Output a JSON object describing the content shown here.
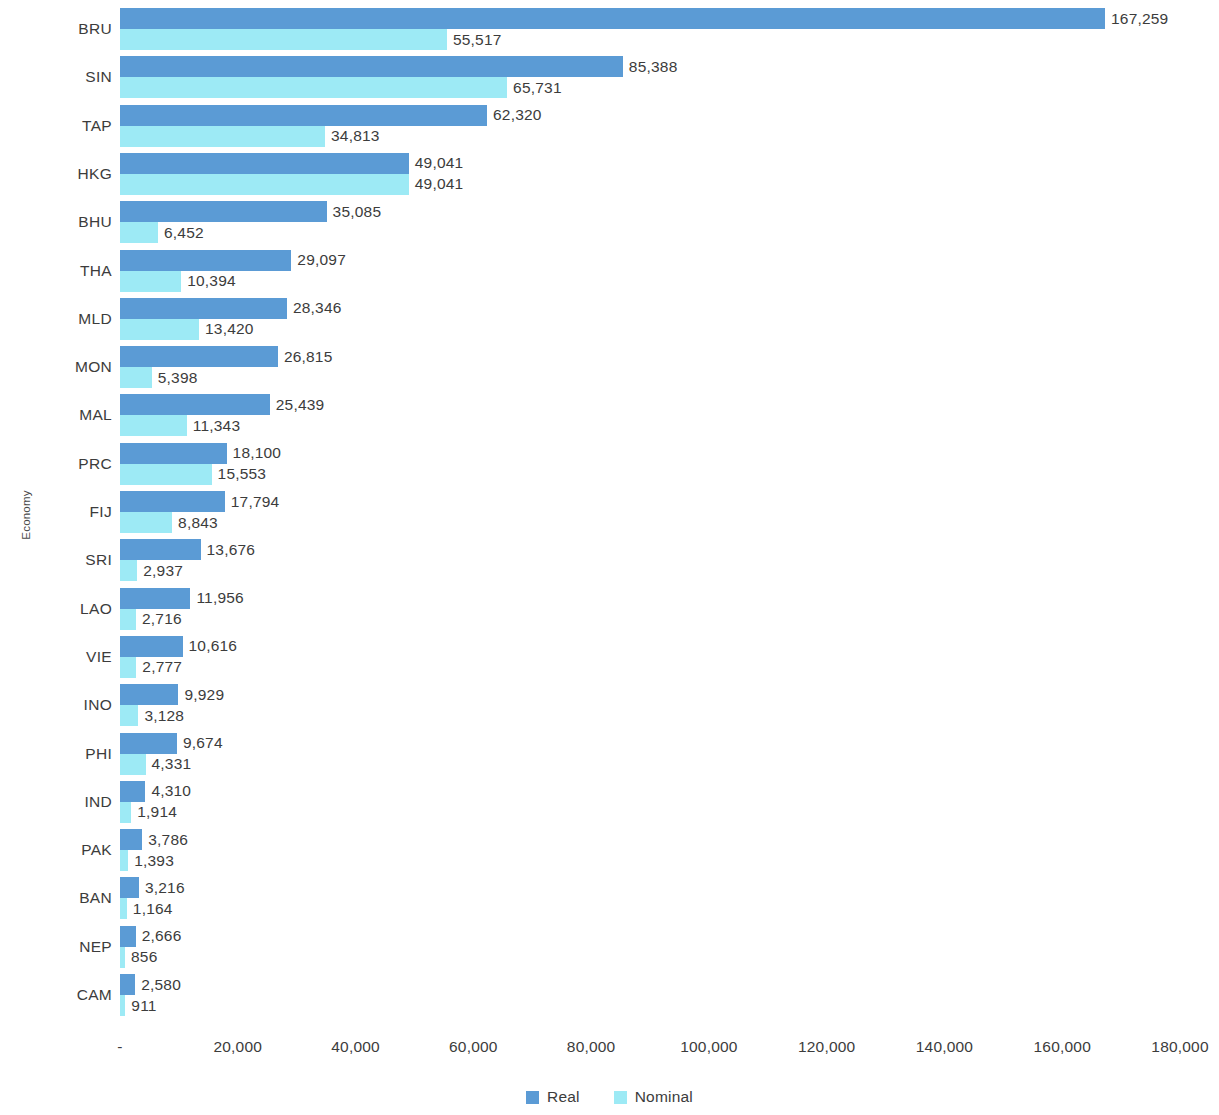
{
  "chart_data": {
    "type": "bar",
    "orientation": "horizontal",
    "title": "",
    "xlabel": "",
    "ylabel": "Economy",
    "xlim": [
      0,
      180000
    ],
    "grid": false,
    "legend_position": "bottom",
    "xticks": [
      "-",
      "20,000",
      "40,000",
      "60,000",
      "80,000",
      "100,000",
      "120,000",
      "140,000",
      "160,000",
      "180,000"
    ],
    "xtick_values": [
      0,
      20000,
      40000,
      60000,
      80000,
      100000,
      120000,
      140000,
      160000,
      180000
    ],
    "categories": [
      "BRU",
      "SIN",
      "TAP",
      "HKG",
      "BHU",
      "THA",
      "MLD",
      "MON",
      "MAL",
      "PRC",
      "FIJ",
      "SRI",
      "LAO",
      "VIE",
      "INO",
      "PHI",
      "IND",
      "PAK",
      "BAN",
      "NEP",
      "CAM"
    ],
    "series": [
      {
        "name": "Real",
        "color": "#5B9BD5",
        "values": [
          167259,
          85388,
          62320,
          49041,
          35085,
          29097,
          28346,
          26815,
          25439,
          18100,
          17794,
          13676,
          11956,
          10616,
          9929,
          9674,
          4310,
          3786,
          3216,
          2666,
          2580
        ],
        "labels": [
          "167,259",
          "85,388",
          "62,320",
          "49,041",
          "35,085",
          "29,097",
          "28,346",
          "26,815",
          "25,439",
          "18,100",
          "17,794",
          "13,676",
          "11,956",
          "10,616",
          "9,929",
          "9,674",
          "4,310",
          "3,786",
          "3,216",
          "2,666",
          "2,580"
        ]
      },
      {
        "name": "Nominal",
        "color": "#9DEAF5",
        "values": [
          55517,
          65731,
          34813,
          49041,
          6452,
          10394,
          13420,
          5398,
          11343,
          15553,
          8843,
          2937,
          2716,
          2777,
          3128,
          4331,
          1914,
          1393,
          1164,
          856,
          911
        ],
        "labels": [
          "55,517",
          "65,731",
          "34,813",
          "49,041",
          "6,452",
          "10,394",
          "13,420",
          "5,398",
          "11,343",
          "15,553",
          "8,843",
          "2,937",
          "2,716",
          "2,777",
          "3,128",
          "4,331",
          "1,914",
          "1,393",
          "1,164",
          "856",
          "911"
        ]
      }
    ]
  },
  "axes": {
    "y_title": "Economy"
  },
  "legend": {
    "items": [
      {
        "label": "Real",
        "color": "#5B9BD5"
      },
      {
        "label": "Nominal",
        "color": "#9DEAF5"
      }
    ]
  }
}
